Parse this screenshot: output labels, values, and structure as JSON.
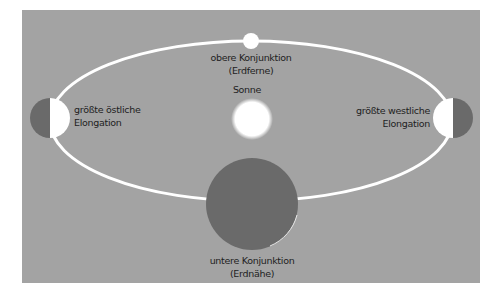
{
  "colors": {
    "background": "#a3a3a3",
    "orbit": "#ffffff",
    "planet_dark": "#6a6a6a",
    "planet_lit": "#ffffff",
    "sun": "#ffffff",
    "text": "#1e1e1e"
  },
  "labels": {
    "superior_conjunction": {
      "line1": "obere Konjunktion",
      "line2": "(Erdferne)"
    },
    "sun": "Sonne",
    "greatest_eastern_elongation": {
      "line1": "größte östliche",
      "line2": "Elongation"
    },
    "greatest_western_elongation": {
      "line1": "größte westliche",
      "line2": "Elongation"
    },
    "inferior_conjunction": {
      "line1": "untere Konjunktion",
      "line2": "(Erdnähe)"
    }
  },
  "geometry": {
    "orbit": {
      "cx": 251,
      "cy": 121,
      "rx": 201,
      "ry": 80
    },
    "sun": {
      "cx": 252,
      "cy": 119,
      "r": 19
    },
    "planet_top": {
      "cx": 251,
      "cy": 41,
      "r": 8
    },
    "planet_left": {
      "cx": 50,
      "cy": 118,
      "r": 20
    },
    "planet_right": {
      "cx": 453,
      "cy": 118,
      "r": 20
    },
    "planet_bottom": {
      "cx": 252,
      "cy": 204,
      "r": 46
    }
  }
}
